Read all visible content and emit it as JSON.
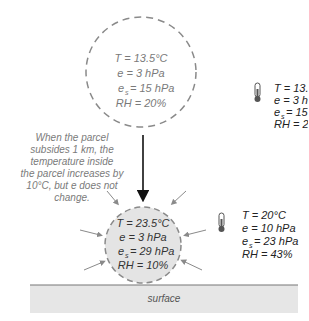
{
  "upper_parcel": {
    "lines": [
      "T = 13.5°C",
      "e = 3 hPa",
      "= 15 hPa",
      "RH = 20%"
    ],
    "es_label": "e",
    "es_sub": "s"
  },
  "upper_environment": {
    "lines": [
      "T = 13.5°C",
      "e = 3 hPa",
      "= 15 hPa",
      "RH = 20%"
    ],
    "es_label": "e",
    "es_sub": "s"
  },
  "annotation": {
    "lines": [
      "When the parcel",
      "subsides 1 km, the",
      "temperature inside",
      "the parcel increases by",
      "10°C, but e does not",
      "change."
    ]
  },
  "lower_parcel": {
    "lines": [
      "T = 23.5°C",
      "e = 3 hPa",
      "= 29 hPa",
      "RH = 10%"
    ],
    "es_label": "e",
    "es_sub": "s"
  },
  "lower_environment": {
    "lines": [
      "T = 20°C",
      "e = 10 hPa",
      "= 23 hPa",
      "RH = 43%"
    ],
    "es_label": "e",
    "es_sub": "s"
  },
  "surface": {
    "label": "surface"
  },
  "colors": {
    "dash": "#8a8a8a",
    "parcel_fill_lower": "#e4e4e4",
    "surface_fill": "#e6e6e6",
    "surface_line": "#777777",
    "text_gray": "#7a7a7a",
    "text_dark": "#222222"
  }
}
